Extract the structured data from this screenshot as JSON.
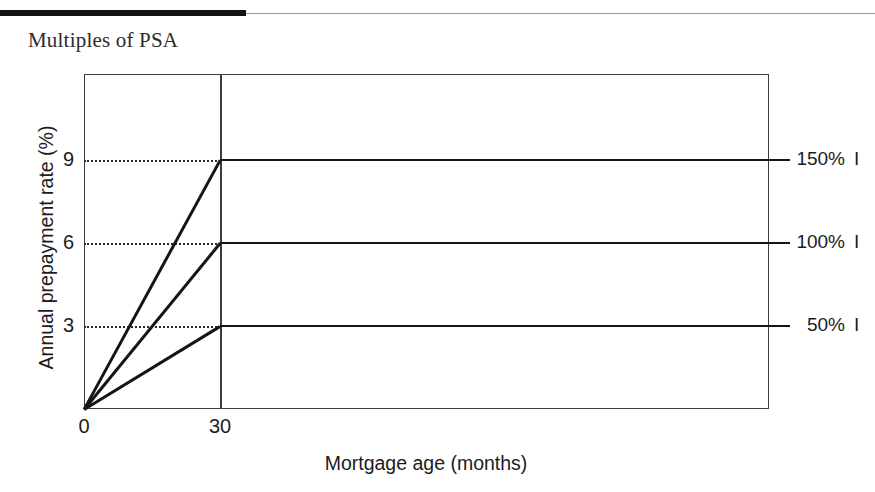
{
  "page": {
    "title": "Multiples of PSA"
  },
  "chart_data": {
    "type": "line",
    "title": "Multiples of PSA",
    "xlabel": "Mortgage age (months)",
    "ylabel": "Annual prepayment rate (%)",
    "xlim": [
      0,
      140
    ],
    "ylim": [
      0,
      12.1
    ],
    "xticks": [
      "0",
      "30"
    ],
    "xtick_values": [
      0,
      30
    ],
    "yticks": [
      "9",
      "6",
      "3"
    ],
    "ytick_values": [
      9,
      6,
      3
    ],
    "grid": "horizontal-dotted-to-month-30",
    "legend_position": "right-of-plot",
    "ramp_end_month": 30,
    "series": [
      {
        "name": "150%",
        "mark": "I",
        "plateau": 9,
        "points": [
          [
            0,
            0
          ],
          [
            30,
            9
          ],
          [
            140,
            9
          ]
        ]
      },
      {
        "name": "100%",
        "mark": "I",
        "plateau": 6,
        "points": [
          [
            0,
            0
          ],
          [
            30,
            6
          ],
          [
            140,
            6
          ]
        ]
      },
      {
        "name": "50%",
        "mark": "I",
        "plateau": 3,
        "points": [
          [
            0,
            0
          ],
          [
            30,
            3
          ],
          [
            140,
            3
          ]
        ]
      }
    ]
  }
}
